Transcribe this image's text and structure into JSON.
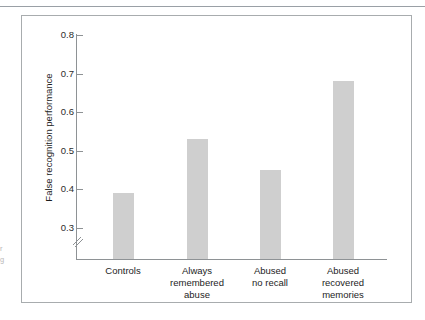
{
  "figure": {
    "caption_sliver_lines": [
      "r",
      "g"
    ]
  },
  "chart_data": {
    "type": "bar",
    "title": "",
    "subtitle": "",
    "xlabel": "",
    "ylabel": "False recognition performance",
    "categories": [
      "Controls",
      "Always remembered abuse",
      "Abused no recall",
      "Abused recovered memories"
    ],
    "category_lines": [
      [
        "Controls"
      ],
      [
        "Always",
        "remembered",
        "abuse"
      ],
      [
        "Abused",
        "no recall"
      ],
      [
        "Abused",
        "recovered",
        "memories"
      ]
    ],
    "values": [
      0.39,
      0.53,
      0.45,
      0.68
    ],
    "ylim": [
      0.25,
      0.8
    ],
    "y_axis_break": true,
    "yticks": [
      0.3,
      0.4,
      0.5,
      0.6,
      0.7,
      0.8
    ],
    "ytick_labels": [
      "0.3",
      "0.4",
      "0.5",
      "0.6",
      "0.7",
      "0.8"
    ],
    "grid": false,
    "legend": null,
    "bar_color": "#cfcfcf",
    "axis_color": "#8e9295",
    "frame_color": "#a8acae"
  }
}
